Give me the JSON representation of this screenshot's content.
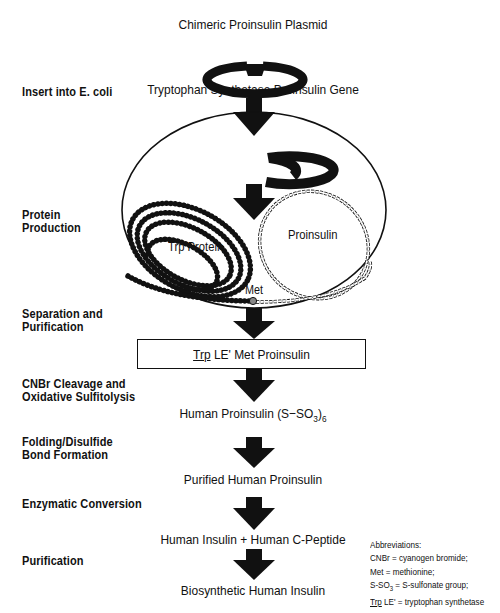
{
  "diagram": {
    "title": "Chimeric Proinsulin Plasmid",
    "gene_label": "Tryptophan Synthetase Proinsulin Gene",
    "cell": {
      "trp_protein_label": "Trp Protein",
      "proinsulin_label": "Proinsulin",
      "met_label": "Met"
    },
    "steps": [
      {
        "label_line1": "Insert into E. coli",
        "label_line2": ""
      },
      {
        "label_line1": "Protein",
        "label_line2": "Production"
      },
      {
        "label_line1": "Separation and",
        "label_line2": "Purification"
      },
      {
        "label_line1": "CNBr Cleavage and",
        "label_line2": "Oxidative Sulfitolysis"
      },
      {
        "label_line1": "Folding/Disulfide",
        "label_line2": "Bond Formation"
      },
      {
        "label_line1": "Enzymatic Conversion",
        "label_line2": ""
      },
      {
        "label_line1": "Purification",
        "label_line2": ""
      }
    ],
    "products": {
      "box_prefix_underlined": "Trp",
      "box_rest": " LE' Met Proinsulin",
      "human_proinsulin": "Human Proinsulin (S−SO",
      "human_proinsulin_sub": "3",
      "human_proinsulin_sup": "-",
      "human_proinsulin_tail": ")",
      "human_proinsulin_sub6": "6",
      "purified": "Purified Human Proinsulin",
      "insulin_cpeptide": "Human Insulin + Human C-Peptide",
      "final": "Biosynthetic Human Insulin"
    },
    "abbreviations": {
      "heading": "Abbreviations:",
      "cnbr": "CNBr = cyanogen bromide;",
      "met": "Met = methionine;",
      "sso3_a": "S-SO",
      "sso3_sub": "3",
      "sso3_b": " = S-sulfonate group;",
      "trp_underlined": "Trp",
      "trp_rest": " LE' = tryptophan synthetase"
    },
    "colors": {
      "ink": "#111111",
      "background": "#ffffff",
      "met_residue": "#888888"
    }
  }
}
